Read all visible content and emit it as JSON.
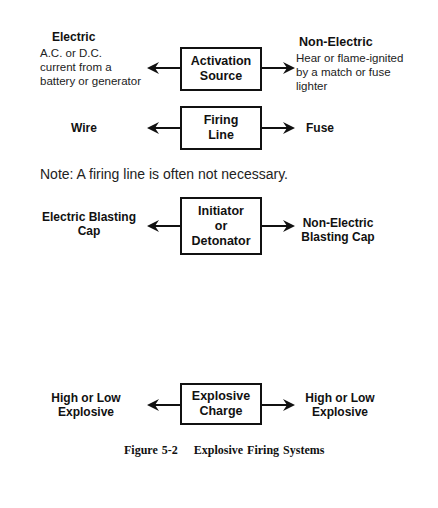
{
  "figure": {
    "caption": "Figure 5-2    Explosive Firing Systems",
    "note": "Note: A firing line is often not necessary.",
    "rows": [
      {
        "box": "Activation\nSource",
        "left": {
          "title": "Electric",
          "desc": "A.C. or D.C.\ncurrent from a\nbattery or generator"
        },
        "right": {
          "title": "Non-Electric",
          "desc": "Hear or flame-ignited\nby a match or fuse\nlighter"
        }
      },
      {
        "box": "Firing\nLine",
        "left": {
          "title": "Wire"
        },
        "right": {
          "title": "Fuse"
        }
      },
      {
        "box": "Initiator\nor\nDetonator",
        "left": {
          "title": "Electric Blasting\nCap"
        },
        "right": {
          "title": "Non-Electric\nBlasting Cap"
        }
      },
      {
        "box": "Explosive\nCharge",
        "left": {
          "title": "High or Low\nExplosive"
        },
        "right": {
          "title": "High or Low\nExplosive"
        }
      }
    ],
    "colors": {
      "line": "#111111",
      "text": "#222222",
      "background": "#ffffff"
    }
  }
}
